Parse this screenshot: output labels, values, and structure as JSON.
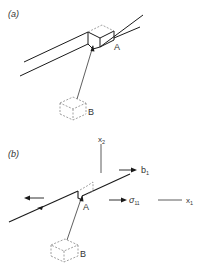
{
  "panels": [
    {
      "label": "(a)",
      "points": {
        "A": "A",
        "B": "B"
      }
    },
    {
      "label": "(b)",
      "points": {
        "A": "A",
        "B": "B"
      },
      "axes": {
        "x1": "x",
        "x1_sub": "1",
        "x2": "x",
        "x2_sub": "2"
      },
      "vectors": {
        "burgers": "b",
        "burgers_sub": "1",
        "stress": "σ",
        "stress_sub": "11"
      }
    }
  ],
  "colors": {
    "line": "#1a1a1a",
    "dashed": "#888888",
    "text": "#333333"
  }
}
